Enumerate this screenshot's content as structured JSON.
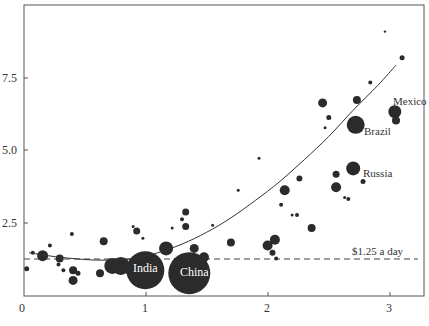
{
  "chart_data": {
    "type": "scatter",
    "title": "",
    "xlabel": "",
    "ylabel": "",
    "xlim": [
      0,
      3.25
    ],
    "ylim": [
      0,
      9.6
    ],
    "xticks": [
      0,
      1,
      2,
      3
    ],
    "xtick_labels": [
      "0",
      "1",
      "2",
      "3"
    ],
    "yticks": [
      2.5,
      5.0,
      7.5
    ],
    "ytick_labels": [
      "2.5",
      "5.0",
      "7.5"
    ],
    "grid": false,
    "legend": null,
    "color": "#2b2b2b",
    "reference_line": {
      "label": "$1.25 a day",
      "y": 1.25,
      "style": "dashed"
    },
    "trend_curve": {
      "style": "solid",
      "points": [
        [
          0.05,
          1.45
        ],
        [
          0.3,
          1.3
        ],
        [
          0.6,
          1.2
        ],
        [
          0.9,
          1.25
        ],
        [
          1.1,
          1.45
        ],
        [
          1.3,
          1.75
        ],
        [
          1.5,
          2.15
        ],
        [
          1.7,
          2.65
        ],
        [
          1.9,
          3.25
        ],
        [
          2.1,
          3.9
        ],
        [
          2.3,
          4.65
        ],
        [
          2.5,
          5.45
        ],
        [
          2.7,
          6.35
        ],
        [
          2.9,
          7.2
        ],
        [
          3.05,
          7.9
        ]
      ]
    },
    "points": [
      {
        "x": 0.03,
        "y": 0.9,
        "r": 2.5
      },
      {
        "x": 0.08,
        "y": 1.45,
        "r": 2
      },
      {
        "x": 0.16,
        "y": 1.35,
        "r": 5.5
      },
      {
        "x": 0.22,
        "y": 1.7,
        "r": 2
      },
      {
        "x": 0.29,
        "y": 1.05,
        "r": 2
      },
      {
        "x": 0.3,
        "y": 1.25,
        "r": 4
      },
      {
        "x": 0.33,
        "y": 0.85,
        "r": 2
      },
      {
        "x": 0.4,
        "y": 2.1,
        "r": 2
      },
      {
        "x": 0.41,
        "y": 0.85,
        "r": 4
      },
      {
        "x": 0.41,
        "y": 0.5,
        "r": 4.5
      },
      {
        "x": 0.45,
        "y": 0.75,
        "r": 2.5
      },
      {
        "x": 0.63,
        "y": 0.75,
        "r": 4
      },
      {
        "x": 0.66,
        "y": 1.85,
        "r": 4
      },
      {
        "x": 0.72,
        "y": 1.1,
        "r": 2.5
      },
      {
        "x": 0.73,
        "y": 1.0,
        "r": 8
      },
      {
        "x": 0.8,
        "y": 1.0,
        "r": 9
      },
      {
        "x": 0.86,
        "y": 0.8,
        "r": 2.5
      },
      {
        "x": 0.9,
        "y": 2.35,
        "r": 1.5
      },
      {
        "x": 0.93,
        "y": 2.2,
        "r": 3.5
      },
      {
        "x": 0.98,
        "y": 1.95,
        "r": 1.5
      },
      {
        "x": 1.0,
        "y": 0.85,
        "r": 19,
        "label": "India"
      },
      {
        "x": 1.17,
        "y": 1.6,
        "r": 7
      },
      {
        "x": 1.22,
        "y": 2.3,
        "r": 1.5
      },
      {
        "x": 1.3,
        "y": 2.6,
        "r": 2
      },
      {
        "x": 1.33,
        "y": 2.85,
        "r": 3.5
      },
      {
        "x": 1.33,
        "y": 2.35,
        "r": 3.5
      },
      {
        "x": 1.36,
        "y": 0.75,
        "r": 21,
        "label": "China"
      },
      {
        "x": 1.4,
        "y": 1.6,
        "r": 4.5
      },
      {
        "x": 1.48,
        "y": 1.3,
        "r": 5
      },
      {
        "x": 1.55,
        "y": 2.4,
        "r": 1.5
      },
      {
        "x": 1.7,
        "y": 1.8,
        "r": 4
      },
      {
        "x": 1.76,
        "y": 3.6,
        "r": 1.5
      },
      {
        "x": 1.93,
        "y": 4.7,
        "r": 1.5
      },
      {
        "x": 2.0,
        "y": 1.7,
        "r": 5
      },
      {
        "x": 2.06,
        "y": 1.9,
        "r": 5
      },
      {
        "x": 2.04,
        "y": 1.45,
        "r": 3
      },
      {
        "x": 2.07,
        "y": 1.25,
        "r": 2
      },
      {
        "x": 2.11,
        "y": 3.1,
        "r": 2
      },
      {
        "x": 2.14,
        "y": 3.6,
        "r": 5
      },
      {
        "x": 2.2,
        "y": 2.75,
        "r": 1.5
      },
      {
        "x": 2.24,
        "y": 2.75,
        "r": 2
      },
      {
        "x": 2.26,
        "y": 4.0,
        "r": 3
      },
      {
        "x": 2.36,
        "y": 2.3,
        "r": 4
      },
      {
        "x": 2.45,
        "y": 6.6,
        "r": 4.5
      },
      {
        "x": 2.5,
        "y": 6.1,
        "r": 2.5
      },
      {
        "x": 2.47,
        "y": 5.75,
        "r": 1.5
      },
      {
        "x": 2.56,
        "y": 3.7,
        "r": 5
      },
      {
        "x": 2.56,
        "y": 4.15,
        "r": 3.5
      },
      {
        "x": 2.63,
        "y": 3.35,
        "r": 1.5
      },
      {
        "x": 2.66,
        "y": 3.3,
        "r": 2
      },
      {
        "x": 2.7,
        "y": 4.35,
        "r": 7,
        "label": "Russia"
      },
      {
        "x": 2.72,
        "y": 5.85,
        "r": 9,
        "label": "Brazil"
      },
      {
        "x": 2.73,
        "y": 6.7,
        "r": 4
      },
      {
        "x": 2.78,
        "y": 3.9,
        "r": 2.5
      },
      {
        "x": 2.84,
        "y": 7.3,
        "r": 2
      },
      {
        "x": 2.96,
        "y": 9.05,
        "r": 1.2
      },
      {
        "x": 3.04,
        "y": 6.3,
        "r": 6.5,
        "label": "Mexico"
      },
      {
        "x": 3.05,
        "y": 6.0,
        "r": 4
      },
      {
        "x": 3.1,
        "y": 8.15,
        "r": 2.5
      }
    ],
    "annotations": [
      {
        "text": "India",
        "x": 1.0,
        "y": 0.85,
        "position": "inside"
      },
      {
        "text": "China",
        "x": 1.36,
        "y": 0.75,
        "position": "inside"
      },
      {
        "text": "Brazil",
        "x": 2.72,
        "y": 5.85,
        "position": "below-right"
      },
      {
        "text": "Russia",
        "x": 2.7,
        "y": 4.35,
        "position": "right"
      },
      {
        "text": "Mexico",
        "x": 3.04,
        "y": 6.3,
        "position": "above"
      },
      {
        "text": "$1.25 a day",
        "x": 3.2,
        "y": 1.25,
        "position": "above-left"
      }
    ]
  },
  "labels": {
    "reference_line": "$1.25 a day",
    "india": "India",
    "china": "China",
    "brazil": "Brazil",
    "russia": "Russia",
    "mexico": "Mexico",
    "x0": "0",
    "x1": "1",
    "x2": "2",
    "x3": "3",
    "y25": "2.5",
    "y50": "5.0",
    "y75": "7.5"
  }
}
